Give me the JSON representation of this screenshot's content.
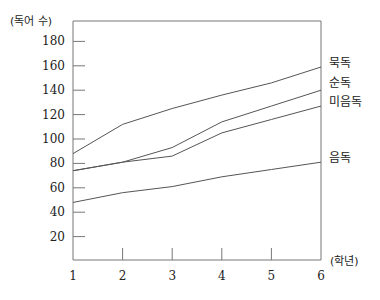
{
  "chart_data": {
    "type": "line",
    "title": "",
    "xlabel": "(학년)",
    "ylabel": "(독어 수)",
    "x": [
      1,
      2,
      3,
      4,
      5,
      6
    ],
    "ylim": [
      0,
      190
    ],
    "yticks": [
      20,
      40,
      60,
      80,
      100,
      120,
      140,
      160,
      180
    ],
    "grid": false,
    "legend_position": "right, inline labels at line ends",
    "series": [
      {
        "name": "묵독",
        "values": [
          88,
          112,
          125,
          136,
          146,
          159
        ]
      },
      {
        "name": "순독",
        "values": [
          74,
          81,
          93,
          114,
          127,
          140
        ]
      },
      {
        "name": "미음독",
        "values": [
          74,
          81,
          86,
          105,
          116,
          127
        ]
      },
      {
        "name": "음독",
        "values": [
          48,
          56,
          61,
          69,
          75,
          81
        ]
      }
    ]
  },
  "axis": {
    "y_unit_label": "(독어 수)",
    "x_unit_label": "(학년)"
  },
  "colors": {
    "line": "#555555",
    "axis": "#777777",
    "text": "#222222"
  }
}
